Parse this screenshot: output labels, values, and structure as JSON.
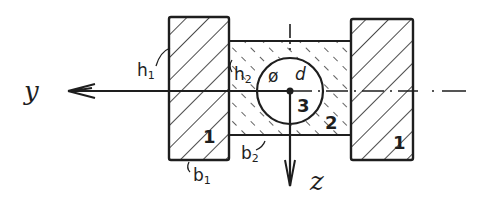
{
  "diagram": {
    "type": "cross-section sketch",
    "style": "hand-drawn",
    "colors": {
      "ink": "#1e1e1e",
      "background": "#ffffff"
    },
    "axes": {
      "y": {
        "label": "y",
        "direction": "left"
      },
      "z": {
        "label": "z",
        "direction": "down"
      }
    },
    "parts": [
      {
        "id": "1",
        "label": "1",
        "description": "left rectangular block",
        "width_label": "b",
        "width_sub": "1",
        "height_label": "h",
        "height_sub": "1"
      },
      {
        "id": "2",
        "label": "2",
        "description": "middle rectangular block",
        "width_label": "b",
        "width_sub": "2",
        "height_label": "h",
        "height_sub": "2"
      },
      {
        "id": "3",
        "label": "3",
        "description": "circular bore",
        "diameter_label": "ø d"
      },
      {
        "id": "1r",
        "label": "1",
        "description": "right rectangular block"
      }
    ],
    "labels": {
      "y_axis": "y",
      "z_axis": "z",
      "h1": "h",
      "h1_sub": "1",
      "h2": "h",
      "h2_sub": "2",
      "b1": "b",
      "b1_sub": "1",
      "b2": "b",
      "b2_sub": "2",
      "diameter_symbol": "ø",
      "diameter": "d",
      "part_left": "1",
      "part_middle": "2",
      "part_circle": "3",
      "part_right": "1"
    }
  }
}
